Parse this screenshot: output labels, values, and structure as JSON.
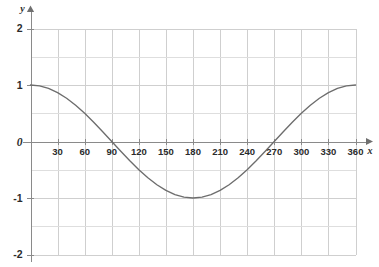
{
  "chart_data": {
    "type": "line",
    "title": "",
    "subtitle": "",
    "xlabel": "x",
    "ylabel": "y",
    "function": "y = cos(x)",
    "x_unit": "degrees",
    "xlim": [
      0,
      360
    ],
    "ylim": [
      -2,
      2
    ],
    "grid": true,
    "grid_x_step": 30,
    "grid_y_step": 0.5,
    "legend": "none",
    "origin_label": "0",
    "x_tick_labels": [
      "30",
      "60",
      "90",
      "120",
      "150",
      "180",
      "210",
      "240",
      "270",
      "300",
      "330",
      "360"
    ],
    "x_tick_values": [
      30,
      60,
      90,
      120,
      150,
      180,
      210,
      240,
      270,
      300,
      330,
      360
    ],
    "y_tick_labels": [
      "2",
      "1",
      "0",
      "-1",
      "-2"
    ],
    "y_tick_values": [
      2,
      1,
      0,
      -1,
      -2
    ],
    "series": [
      {
        "name": "y = cos(x)",
        "color": "#6d6d6d",
        "x": [
          0,
          10,
          20,
          30,
          40,
          50,
          60,
          70,
          80,
          90,
          100,
          110,
          120,
          130,
          140,
          150,
          160,
          170,
          180,
          190,
          200,
          210,
          220,
          230,
          240,
          250,
          260,
          270,
          280,
          290,
          300,
          310,
          320,
          330,
          340,
          350,
          360
        ],
        "values": [
          1,
          0.985,
          0.94,
          0.866,
          0.766,
          0.643,
          0.5,
          0.342,
          0.174,
          0,
          -0.174,
          -0.342,
          -0.5,
          -0.643,
          -0.766,
          -0.866,
          -0.94,
          -0.985,
          -1,
          -0.985,
          -0.94,
          -0.866,
          -0.766,
          -0.643,
          -0.5,
          -0.342,
          -0.174,
          0,
          0.174,
          0.342,
          0.5,
          0.643,
          0.766,
          0.866,
          0.94,
          0.985,
          1
        ]
      }
    ],
    "key_points": [
      {
        "label": "maximum-start",
        "x": 0,
        "y": 1
      },
      {
        "label": "zero-crossing",
        "x": 90,
        "y": 0
      },
      {
        "label": "minimum",
        "x": 180,
        "y": -1
      },
      {
        "label": "zero-crossing",
        "x": 270,
        "y": 0
      },
      {
        "label": "maximum-end",
        "x": 360,
        "y": 1
      }
    ]
  },
  "colors": {
    "curve": "#6d6d6d",
    "grid": "#cfcfcf",
    "axis": "#8a8a8a",
    "text": "#2b2b2b",
    "background": "#ffffff"
  }
}
